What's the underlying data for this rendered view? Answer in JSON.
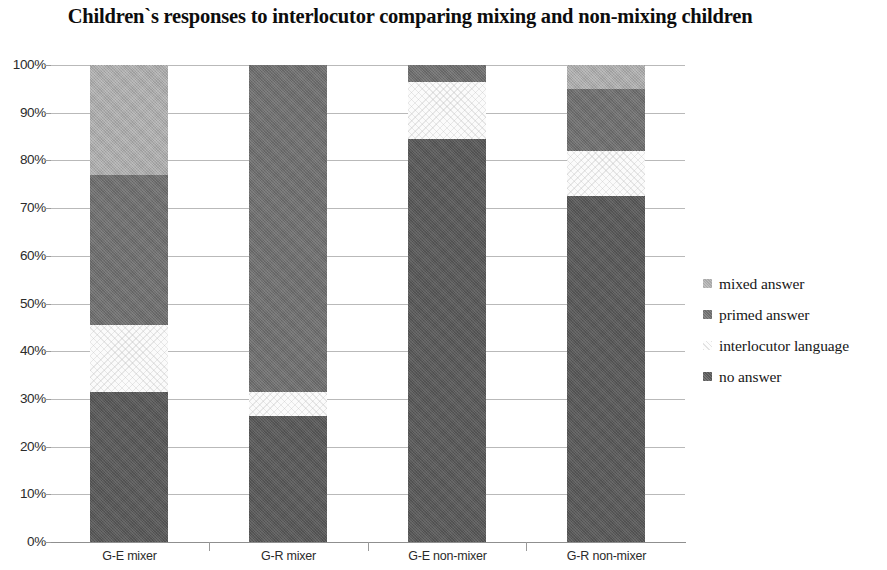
{
  "chart_data": {
    "type": "bar",
    "subtype": "stacked-100-percent",
    "title": "Children`s responses to interlocutor comparing mixing and non-mixing children",
    "xlabel": "",
    "ylabel": "",
    "ylim": [
      0,
      100
    ],
    "ytick_labels": [
      "100%",
      "90%",
      "80%",
      "70%",
      "60%",
      "50%",
      "40%",
      "30%",
      "20%",
      "10%",
      "0%"
    ],
    "ytick_values": [
      100,
      90,
      80,
      70,
      60,
      50,
      40,
      30,
      20,
      10,
      0
    ],
    "grid": true,
    "legend_position": "right",
    "categories": [
      "G-E mixer",
      "G-R mixer",
      "G-E non-mixer",
      "G-R non-mixer"
    ],
    "stack_order_bottom_to_top": [
      "no answer",
      "interlocutor language",
      "primed answer",
      "mixed answer"
    ],
    "series": [
      {
        "name": "no answer",
        "color": "#585858",
        "values": [
          31.5,
          26.5,
          84.5,
          72.5
        ]
      },
      {
        "name": "interlocutor language",
        "color": "#fbfbfb",
        "values": [
          14.0,
          5.0,
          12.0,
          9.5
        ]
      },
      {
        "name": "primed answer",
        "color": "#6d6d6d",
        "values": [
          31.5,
          68.5,
          3.5,
          13.0
        ]
      },
      {
        "name": "mixed answer",
        "color": "#a9a9a9",
        "values": [
          23.0,
          0.0,
          0.0,
          5.0
        ]
      }
    ],
    "cumulative_tops": [
      [
        31.5,
        45.5,
        77.0,
        100.0
      ],
      [
        26.5,
        31.5,
        100.0,
        100.0
      ],
      [
        84.5,
        96.5,
        100.0,
        100.0
      ],
      [
        72.5,
        82.0,
        95.0,
        100.0
      ]
    ]
  },
  "legend": {
    "items": [
      {
        "label": "mixed answer",
        "swatch_class": "sw-mixed",
        "name": "mixed-answer"
      },
      {
        "label": "primed answer",
        "swatch_class": "sw-primed",
        "name": "primed-answer"
      },
      {
        "label": "interlocutor language",
        "swatch_class": "sw-interlocutor",
        "name": "interlocutor-language"
      },
      {
        "label": "no answer",
        "swatch_class": "sw-no-answer",
        "name": "no-answer"
      }
    ]
  }
}
